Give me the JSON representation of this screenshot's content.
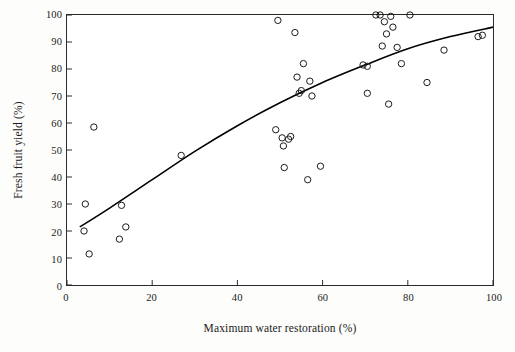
{
  "chart_data": {
    "type": "scatter",
    "title": "",
    "xlabel": "Maximum water restoration (%)",
    "ylabel": "Fresh fruit yield (%)",
    "xlim": [
      0,
      100
    ],
    "ylim": [
      0,
      100
    ],
    "xticks": [
      0,
      20,
      40,
      60,
      80,
      100
    ],
    "yticks": [
      0,
      10,
      20,
      30,
      40,
      50,
      60,
      70,
      80,
      90,
      100
    ],
    "grid": false,
    "legend": null,
    "marker": "open-circle",
    "points": [
      {
        "x": 4.0,
        "y": 20.0
      },
      {
        "x": 4.3,
        "y": 30.0
      },
      {
        "x": 5.2,
        "y": 11.5
      },
      {
        "x": 6.3,
        "y": 58.5
      },
      {
        "x": 12.3,
        "y": 17.0
      },
      {
        "x": 12.8,
        "y": 29.5
      },
      {
        "x": 13.8,
        "y": 21.5
      },
      {
        "x": 26.8,
        "y": 48.0
      },
      {
        "x": 49.0,
        "y": 57.5
      },
      {
        "x": 49.5,
        "y": 98.0
      },
      {
        "x": 50.5,
        "y": 54.5
      },
      {
        "x": 50.8,
        "y": 51.5
      },
      {
        "x": 51.0,
        "y": 43.5
      },
      {
        "x": 52.0,
        "y": 54.0
      },
      {
        "x": 52.5,
        "y": 55.0
      },
      {
        "x": 53.5,
        "y": 93.5
      },
      {
        "x": 54.0,
        "y": 77.0
      },
      {
        "x": 54.5,
        "y": 71.0
      },
      {
        "x": 55.0,
        "y": 72.0
      },
      {
        "x": 55.5,
        "y": 82.0
      },
      {
        "x": 56.5,
        "y": 39.0
      },
      {
        "x": 57.0,
        "y": 75.5
      },
      {
        "x": 57.5,
        "y": 70.0
      },
      {
        "x": 59.5,
        "y": 44.0
      },
      {
        "x": 69.5,
        "y": 81.5
      },
      {
        "x": 70.5,
        "y": 81.0
      },
      {
        "x": 70.5,
        "y": 71.0
      },
      {
        "x": 72.5,
        "y": 100.0
      },
      {
        "x": 73.5,
        "y": 100.0
      },
      {
        "x": 74.0,
        "y": 88.5
      },
      {
        "x": 74.5,
        "y": 97.5
      },
      {
        "x": 75.0,
        "y": 93.0
      },
      {
        "x": 75.5,
        "y": 67.0
      },
      {
        "x": 76.0,
        "y": 99.5
      },
      {
        "x": 76.5,
        "y": 95.5
      },
      {
        "x": 77.5,
        "y": 88.0
      },
      {
        "x": 78.5,
        "y": 82.0
      },
      {
        "x": 80.5,
        "y": 100.0
      },
      {
        "x": 84.5,
        "y": 75.0
      },
      {
        "x": 88.5,
        "y": 87.0
      },
      {
        "x": 96.5,
        "y": 92.0
      },
      {
        "x": 97.5,
        "y": 92.5
      }
    ],
    "fit_curve": {
      "description": "fitted quadratic trend line",
      "points": [
        {
          "x": 3.0,
          "y": 21.5
        },
        {
          "x": 10.0,
          "y": 28.5
        },
        {
          "x": 20.0,
          "y": 39.0
        },
        {
          "x": 30.0,
          "y": 49.5
        },
        {
          "x": 40.0,
          "y": 59.0
        },
        {
          "x": 50.0,
          "y": 67.5
        },
        {
          "x": 60.0,
          "y": 75.0
        },
        {
          "x": 70.0,
          "y": 81.5
        },
        {
          "x": 80.0,
          "y": 87.5
        },
        {
          "x": 90.0,
          "y": 92.0
        },
        {
          "x": 100.0,
          "y": 95.5
        }
      ]
    },
    "colors": {
      "axis": "#2b2b2b",
      "marker": "#1a1a1a",
      "curve": "#000000",
      "background": "#ffffff"
    }
  }
}
